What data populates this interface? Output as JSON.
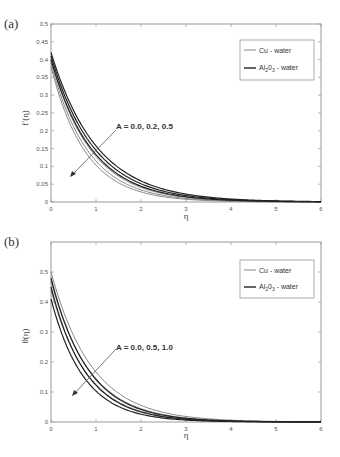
{
  "chart_data": [
    {
      "panel": "(a)",
      "type": "line",
      "title": "",
      "xlabel": "η",
      "ylabel": "f′(η)",
      "xlim": [
        0,
        6
      ],
      "ylim": [
        0,
        0.5
      ],
      "xticks": [
        0,
        1,
        2,
        3,
        4,
        5,
        6
      ],
      "yticks": [
        0,
        0.05,
        0.1,
        0.15,
        0.2,
        0.25,
        0.3,
        0.35,
        0.4,
        0.45,
        0.5
      ],
      "grid": false,
      "legend_position": "upper right",
      "legend": [
        "Cu - water",
        "Al2O3 - water"
      ],
      "annotation": "A = 0.0, 0.2, 0.5",
      "series": [
        {
          "name": "Cu - water, A=0.0",
          "color": "#888888",
          "start": 0.38,
          "decay": 1.3
        },
        {
          "name": "Cu - water, A=0.2",
          "color": "#888888",
          "start": 0.39,
          "decay": 1.22
        },
        {
          "name": "Cu - water, A=0.5",
          "color": "#888888",
          "start": 0.4,
          "decay": 1.14
        },
        {
          "name": "Al2O3 - water, A=0.0",
          "color": "#222222",
          "start": 0.4,
          "decay": 1.1
        },
        {
          "name": "Al2O3 - water, A=0.2",
          "color": "#222222",
          "start": 0.41,
          "decay": 1.04
        },
        {
          "name": "Al2O3 - water, A=0.5",
          "color": "#222222",
          "start": 0.42,
          "decay": 0.98
        }
      ]
    },
    {
      "panel": "(b)",
      "type": "line",
      "title": "",
      "xlabel": "η",
      "ylabel": "θ(η)",
      "xlim": [
        0,
        6
      ],
      "ylim": [
        0,
        0.6
      ],
      "xticks": [
        0,
        1,
        2,
        3,
        4,
        5,
        6
      ],
      "yticks": [
        0,
        0.1,
        0.2,
        0.3,
        0.4,
        0.5
      ],
      "grid": false,
      "legend_position": "upper right",
      "legend": [
        "Cu - water",
        "Al2O3 - water"
      ],
      "annotation": "A = 0.0, 0.5, 1.0",
      "series": [
        {
          "name": "Cu - water, A=0.0",
          "color": "#888888",
          "start": 0.5,
          "decay": 1.1
        },
        {
          "name": "Cu - water, A=0.5",
          "color": "#888888",
          "start": 0.47,
          "decay": 1.18
        },
        {
          "name": "Cu - water, A=1.0",
          "color": "#888888",
          "start": 0.44,
          "decay": 1.26
        },
        {
          "name": "Al2O3 - water, A=0.0",
          "color": "#222222",
          "start": 0.48,
          "decay": 1.22
        },
        {
          "name": "Al2O3 - water, A=0.5",
          "color": "#222222",
          "start": 0.45,
          "decay": 1.3
        },
        {
          "name": "Al2O3 - water, A=1.0",
          "color": "#222222",
          "start": 0.41,
          "decay": 1.38
        }
      ]
    }
  ],
  "panels": {
    "a": {
      "label": "(a)",
      "ylabel": "f′(η)",
      "xlabel": "η",
      "annotation": "A = 0.0, 0.2, 0.5",
      "legend_cu": "Cu - water",
      "legend_al_main": "Al",
      "legend_al_sub1": "2",
      "legend_al_mid": "0",
      "legend_al_sub2": "3",
      "legend_al_tail": " - water"
    },
    "b": {
      "label": "(b)",
      "ylabel": "θ(η)",
      "xlabel": "η",
      "annotation": "A = 0.0, 0.5, 1.0",
      "legend_cu": "Cu - water",
      "legend_al_main": "Al",
      "legend_al_sub1": "2",
      "legend_al_mid": "0",
      "legend_al_sub2": "3",
      "legend_al_tail": " - water"
    }
  }
}
